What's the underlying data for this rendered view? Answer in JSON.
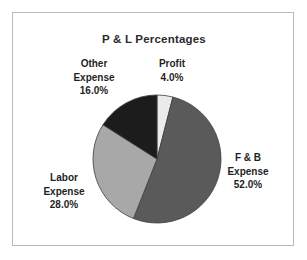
{
  "chart_data": {
    "type": "pie",
    "title": "P & L Percentages",
    "xlabel": "",
    "ylabel": "",
    "categories": [
      "Profit",
      "F & B Expense",
      "Labor Expense",
      "Other Expense"
    ],
    "values": [
      4.0,
      52.0,
      28.0,
      16.0
    ],
    "value_labels": [
      "4.0%",
      "52.0%",
      "28.0%",
      "16.0%"
    ],
    "units": "percent",
    "total": 100.0,
    "start_angle_deg": 0,
    "direction": "clockwise",
    "legend": "none",
    "grid": false,
    "slice_colors": [
      "#ebebeb",
      "#5a5a5a",
      "#a8a8a8",
      "#1c1c1c"
    ],
    "slice_outline": "#3d3d3d",
    "labels_position": "outside",
    "slices": [
      {
        "name": "Profit",
        "value": 4.0,
        "label": "4.0%",
        "color": "#ebebeb"
      },
      {
        "name": "F & B Expense",
        "value": 52.0,
        "label": "52.0%",
        "color": "#5a5a5a"
      },
      {
        "name": "Labor Expense",
        "value": 28.0,
        "label": "28.0%",
        "color": "#a8a8a8"
      },
      {
        "name": "Other Expense",
        "value": 16.0,
        "label": "16.0%",
        "color": "#1c1c1c"
      }
    ]
  },
  "title": "P & L Percentages",
  "labels": {
    "other": {
      "line1": "Other",
      "line2": "Expense",
      "value": "16.0%"
    },
    "profit": {
      "line1": "Profit",
      "line2": "",
      "value": "4.0%"
    },
    "fb": {
      "line1": "F & B",
      "line2": "Expense",
      "value": "52.0%"
    },
    "labor": {
      "line1": "Labor",
      "line2": "Expense",
      "value": "28.0%"
    }
  },
  "colors": {
    "frame_border": "#b9b9b9",
    "background": "#ffffff",
    "text": "#1f1f1f",
    "profit": "#ebebeb",
    "fb_expense": "#5a5a5a",
    "labor_expense": "#a8a8a8",
    "other_expense": "#1c1c1c"
  }
}
